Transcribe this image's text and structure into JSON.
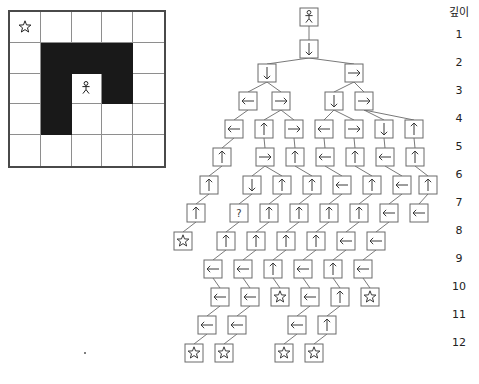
{
  "maze": {
    "rows": 5,
    "cols": 5,
    "wall_color": "#191919",
    "grid_line_color": "#8e8e8e",
    "border_color": "#4a4a4a",
    "cells": [
      [
        "star",
        "empty",
        "empty",
        "empty",
        "empty"
      ],
      [
        "empty",
        "wall",
        "wall",
        "wall",
        "empty"
      ],
      [
        "empty",
        "wall",
        "person",
        "wall",
        "empty"
      ],
      [
        "empty",
        "wall",
        "empty",
        "empty",
        "empty"
      ],
      [
        "empty",
        "empty",
        "empty",
        "empty",
        "empty"
      ]
    ],
    "star_label": "star-goal",
    "person_label": "person-start"
  },
  "depth_legend": {
    "title": "깊이",
    "levels": [
      "1",
      "2",
      "3",
      "4",
      "5",
      "6",
      "7",
      "8",
      "9",
      "10",
      "11",
      "12"
    ]
  },
  "tree": {
    "node_size": 18,
    "node_stroke": "#6a6a6a",
    "edge_stroke": "#6a6a6a",
    "glyphs": {
      "person": "person-icon",
      "down": "arrow-down-icon",
      "up": "arrow-up-icon",
      "left": "arrow-left-icon",
      "right": "arrow-right-icon",
      "star": "star-icon",
      "question": "question-icon"
    },
    "nodes": [
      {
        "id": "n0",
        "glyph": "person",
        "x": 309,
        "y": 17,
        "depth": 0
      },
      {
        "id": "n1",
        "glyph": "down",
        "x": 309,
        "y": 49,
        "depth": 1
      },
      {
        "id": "n2a",
        "glyph": "down",
        "x": 267,
        "y": 73,
        "depth": 2
      },
      {
        "id": "n2b",
        "glyph": "right",
        "x": 354,
        "y": 73,
        "depth": 2
      },
      {
        "id": "n3a",
        "glyph": "left",
        "x": 248,
        "y": 101,
        "depth": 3
      },
      {
        "id": "n3b",
        "glyph": "right",
        "x": 281,
        "y": 101,
        "depth": 3
      },
      {
        "id": "n3c",
        "glyph": "down",
        "x": 334,
        "y": 101,
        "depth": 3
      },
      {
        "id": "n3d",
        "glyph": "right",
        "x": 364,
        "y": 101,
        "depth": 3
      },
      {
        "id": "n4a",
        "glyph": "left",
        "x": 234,
        "y": 129,
        "depth": 4
      },
      {
        "id": "n4b",
        "glyph": "up",
        "x": 264,
        "y": 129,
        "depth": 4
      },
      {
        "id": "n4c",
        "glyph": "right",
        "x": 294,
        "y": 129,
        "depth": 4
      },
      {
        "id": "n4d",
        "glyph": "left",
        "x": 324,
        "y": 129,
        "depth": 4
      },
      {
        "id": "n4e",
        "glyph": "right",
        "x": 354,
        "y": 129,
        "depth": 4
      },
      {
        "id": "n4f",
        "glyph": "down",
        "x": 384,
        "y": 129,
        "depth": 4
      },
      {
        "id": "n4g",
        "glyph": "up",
        "x": 414,
        "y": 129,
        "depth": 4
      },
      {
        "id": "n5a",
        "glyph": "up",
        "x": 222,
        "y": 157,
        "depth": 5
      },
      {
        "id": "n5b",
        "glyph": "right",
        "x": 265,
        "y": 157,
        "depth": 5
      },
      {
        "id": "n5c",
        "glyph": "up",
        "x": 295,
        "y": 157,
        "depth": 5
      },
      {
        "id": "n5d",
        "glyph": "left",
        "x": 325,
        "y": 157,
        "depth": 5
      },
      {
        "id": "n5e",
        "glyph": "up",
        "x": 355,
        "y": 157,
        "depth": 5
      },
      {
        "id": "n5f",
        "glyph": "left",
        "x": 385,
        "y": 157,
        "depth": 5
      },
      {
        "id": "n5g",
        "glyph": "up",
        "x": 415,
        "y": 157,
        "depth": 5
      },
      {
        "id": "n6a",
        "glyph": "up",
        "x": 209,
        "y": 185,
        "depth": 6
      },
      {
        "id": "n6b",
        "glyph": "down",
        "x": 252,
        "y": 185,
        "depth": 6
      },
      {
        "id": "n6c",
        "glyph": "up",
        "x": 282,
        "y": 185,
        "depth": 6
      },
      {
        "id": "n6d",
        "glyph": "up",
        "x": 312,
        "y": 185,
        "depth": 6
      },
      {
        "id": "n6e",
        "glyph": "left",
        "x": 342,
        "y": 185,
        "depth": 6
      },
      {
        "id": "n6f",
        "glyph": "up",
        "x": 372,
        "y": 185,
        "depth": 6
      },
      {
        "id": "n6g",
        "glyph": "left",
        "x": 402,
        "y": 185,
        "depth": 6
      },
      {
        "id": "n6h",
        "glyph": "up",
        "x": 428,
        "y": 185,
        "depth": 6
      },
      {
        "id": "n7a",
        "glyph": "up",
        "x": 196,
        "y": 213,
        "depth": 7
      },
      {
        "id": "n7b",
        "glyph": "question",
        "x": 239,
        "y": 213,
        "depth": 7
      },
      {
        "id": "n7c",
        "glyph": "up",
        "x": 269,
        "y": 213,
        "depth": 7
      },
      {
        "id": "n7d",
        "glyph": "up",
        "x": 299,
        "y": 213,
        "depth": 7
      },
      {
        "id": "n7e",
        "glyph": "up",
        "x": 329,
        "y": 213,
        "depth": 7
      },
      {
        "id": "n7f",
        "glyph": "up",
        "x": 359,
        "y": 213,
        "depth": 7
      },
      {
        "id": "n7g",
        "glyph": "left",
        "x": 389,
        "y": 213,
        "depth": 7
      },
      {
        "id": "n7h",
        "glyph": "left",
        "x": 419,
        "y": 213,
        "depth": 7
      },
      {
        "id": "n8a",
        "glyph": "star",
        "x": 183,
        "y": 241,
        "depth": 8
      },
      {
        "id": "n8b",
        "glyph": "up",
        "x": 226,
        "y": 241,
        "depth": 8
      },
      {
        "id": "n8c",
        "glyph": "up",
        "x": 256,
        "y": 241,
        "depth": 8
      },
      {
        "id": "n8d",
        "glyph": "up",
        "x": 286,
        "y": 241,
        "depth": 8
      },
      {
        "id": "n8e",
        "glyph": "up",
        "x": 316,
        "y": 241,
        "depth": 8
      },
      {
        "id": "n8f",
        "glyph": "left",
        "x": 346,
        "y": 241,
        "depth": 8
      },
      {
        "id": "n8g",
        "glyph": "left",
        "x": 376,
        "y": 241,
        "depth": 8
      },
      {
        "id": "n9a",
        "glyph": "left",
        "x": 213,
        "y": 269,
        "depth": 9
      },
      {
        "id": "n9b",
        "glyph": "left",
        "x": 243,
        "y": 269,
        "depth": 9
      },
      {
        "id": "n9c",
        "glyph": "up",
        "x": 273,
        "y": 269,
        "depth": 9
      },
      {
        "id": "n9d",
        "glyph": "left",
        "x": 303,
        "y": 269,
        "depth": 9
      },
      {
        "id": "n9e",
        "glyph": "up",
        "x": 333,
        "y": 269,
        "depth": 9
      },
      {
        "id": "n9f",
        "glyph": "left",
        "x": 363,
        "y": 269,
        "depth": 9
      },
      {
        "id": "n10a",
        "glyph": "left",
        "x": 220,
        "y": 297,
        "depth": 10
      },
      {
        "id": "n10b",
        "glyph": "left",
        "x": 250,
        "y": 297,
        "depth": 10
      },
      {
        "id": "n10c",
        "glyph": "star",
        "x": 280,
        "y": 297,
        "depth": 10
      },
      {
        "id": "n10d",
        "glyph": "left",
        "x": 310,
        "y": 297,
        "depth": 10
      },
      {
        "id": "n10e",
        "glyph": "up",
        "x": 340,
        "y": 297,
        "depth": 10
      },
      {
        "id": "n10f",
        "glyph": "star",
        "x": 370,
        "y": 297,
        "depth": 10
      },
      {
        "id": "n11a",
        "glyph": "left",
        "x": 207,
        "y": 325,
        "depth": 11
      },
      {
        "id": "n11b",
        "glyph": "left",
        "x": 237,
        "y": 325,
        "depth": 11
      },
      {
        "id": "n11c",
        "glyph": "left",
        "x": 297,
        "y": 325,
        "depth": 11
      },
      {
        "id": "n11d",
        "glyph": "up",
        "x": 327,
        "y": 325,
        "depth": 11
      },
      {
        "id": "n12a",
        "glyph": "star",
        "x": 194,
        "y": 353,
        "depth": 12
      },
      {
        "id": "n12b",
        "glyph": "star",
        "x": 224,
        "y": 353,
        "depth": 12
      },
      {
        "id": "n12c",
        "glyph": "star",
        "x": 284,
        "y": 353,
        "depth": 12
      },
      {
        "id": "n12d",
        "glyph": "star",
        "x": 314,
        "y": 353,
        "depth": 12
      }
    ],
    "edges": [
      [
        "n0",
        "n1"
      ],
      [
        "n1",
        "n2a"
      ],
      [
        "n1",
        "n2b"
      ],
      [
        "n2a",
        "n3a"
      ],
      [
        "n2a",
        "n3b"
      ],
      [
        "n2b",
        "n3c"
      ],
      [
        "n2b",
        "n3d"
      ],
      [
        "n3a",
        "n4a"
      ],
      [
        "n3b",
        "n4b"
      ],
      [
        "n3b",
        "n4c"
      ],
      [
        "n3c",
        "n4d"
      ],
      [
        "n3c",
        "n4e"
      ],
      [
        "n3d",
        "n4f"
      ],
      [
        "n3d",
        "n4g"
      ],
      [
        "n4a",
        "n5a"
      ],
      [
        "n4b",
        "n5b"
      ],
      [
        "n4c",
        "n5c"
      ],
      [
        "n4d",
        "n5d"
      ],
      [
        "n4e",
        "n5e"
      ],
      [
        "n4f",
        "n5f"
      ],
      [
        "n4g",
        "n5g"
      ],
      [
        "n5a",
        "n6a"
      ],
      [
        "n5b",
        "n6b"
      ],
      [
        "n5b",
        "n6c"
      ],
      [
        "n5c",
        "n6d"
      ],
      [
        "n5d",
        "n6e"
      ],
      [
        "n5e",
        "n6f"
      ],
      [
        "n5f",
        "n6g"
      ],
      [
        "n5g",
        "n6h"
      ],
      [
        "n6a",
        "n7a"
      ],
      [
        "n6b",
        "n7b"
      ],
      [
        "n6c",
        "n7c"
      ],
      [
        "n6d",
        "n7d"
      ],
      [
        "n6e",
        "n7e"
      ],
      [
        "n6f",
        "n7f"
      ],
      [
        "n6g",
        "n7g"
      ],
      [
        "n6h",
        "n7h"
      ],
      [
        "n7a",
        "n8a"
      ],
      [
        "n7b",
        "n8b"
      ],
      [
        "n7c",
        "n8c"
      ],
      [
        "n7d",
        "n8d"
      ],
      [
        "n7e",
        "n8e"
      ],
      [
        "n7f",
        "n8f"
      ],
      [
        "n7g",
        "n8g"
      ],
      [
        "n8b",
        "n9a"
      ],
      [
        "n8c",
        "n9b"
      ],
      [
        "n8d",
        "n9c"
      ],
      [
        "n8e",
        "n9d"
      ],
      [
        "n8f",
        "n9e"
      ],
      [
        "n8g",
        "n9f"
      ],
      [
        "n9a",
        "n10a"
      ],
      [
        "n9b",
        "n10b"
      ],
      [
        "n9c",
        "n10c"
      ],
      [
        "n9d",
        "n10d"
      ],
      [
        "n9e",
        "n10e"
      ],
      [
        "n9f",
        "n10f"
      ],
      [
        "n10a",
        "n11a"
      ],
      [
        "n10b",
        "n11b"
      ],
      [
        "n10d",
        "n11c"
      ],
      [
        "n10e",
        "n11d"
      ],
      [
        "n11a",
        "n12a"
      ],
      [
        "n11b",
        "n12b"
      ],
      [
        "n11c",
        "n12c"
      ],
      [
        "n11d",
        "n12d"
      ]
    ]
  }
}
